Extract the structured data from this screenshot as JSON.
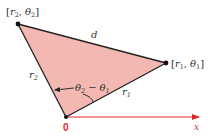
{
  "diagram": {
    "colors": {
      "triangle_fill": "#f4b8b2",
      "triangle_stroke": "#222222",
      "axis": "#e0282e",
      "text": "#333333"
    },
    "points": {
      "origin": {
        "label": "0",
        "x": 66,
        "y": 117
      },
      "p1": {
        "label_r": "r",
        "label_r_sub": "1",
        "label_theta": "θ",
        "label_theta_sub": "1",
        "x": 166,
        "y": 63
      },
      "p2": {
        "label_r": "r",
        "label_r_sub": "2",
        "label_theta": "θ",
        "label_theta_sub": "2",
        "x": 18,
        "y": 24
      }
    },
    "edges": {
      "d_label": "d",
      "r1_label": "r",
      "r1_sub": "1",
      "r2_label": "r",
      "r2_sub": "2"
    },
    "angle": {
      "theta": "θ",
      "sub_a": "2",
      "minus": "−",
      "sub_b": "1"
    },
    "axis": {
      "label": "x"
    },
    "brackets": {
      "open": "[",
      "close": "]",
      "comma": ","
    }
  }
}
